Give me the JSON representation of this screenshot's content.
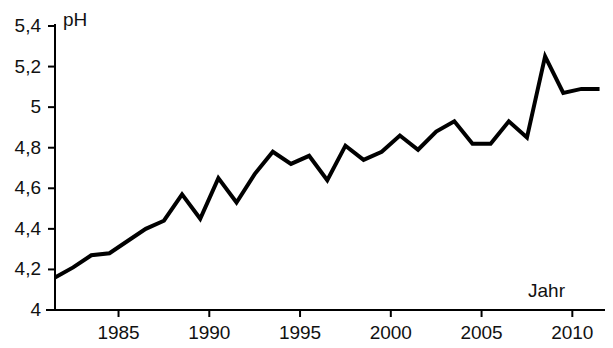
{
  "chart_data": {
    "type": "line",
    "title": "",
    "subtitle": "",
    "xlabel": "Jahr",
    "ylabel": "pH",
    "xlim": [
      1981.5,
      2011.8
    ],
    "ylim": [
      4,
      5.4
    ],
    "grid": false,
    "legend": null,
    "annotations": [],
    "y_ticks": [
      4,
      4.2,
      4.4,
      4.6,
      4.8,
      5,
      5.2,
      5.4
    ],
    "y_tick_labels": [
      "4",
      "4,2",
      "4,4",
      "4,6",
      "4,8",
      "5",
      "5,2",
      "5,4"
    ],
    "x_ticks": [
      1985,
      1990,
      1995,
      2000,
      2005,
      2010
    ],
    "x_tick_labels": [
      "1985",
      "1990",
      "1995",
      "2000",
      "2005",
      "2010"
    ],
    "series": [
      {
        "name": "pH",
        "color": "#000000",
        "x": [
          1981.5,
          1982.5,
          1983.5,
          1984.5,
          1985.5,
          1986.5,
          1987.5,
          1988.5,
          1989.5,
          1990.5,
          1991.5,
          1992.5,
          1993.5,
          1994.5,
          1995.5,
          1996.5,
          1997.5,
          1998.5,
          1999.5,
          2000.5,
          2001.5,
          2002.5,
          2003.5,
          2004.5,
          2005.5,
          2006.5,
          2007.5,
          2008.5,
          2009.5,
          2010.5,
          2011.5
        ],
        "values": [
          4.16,
          4.21,
          4.27,
          4.28,
          4.34,
          4.4,
          4.44,
          4.57,
          4.45,
          4.65,
          4.53,
          4.67,
          4.78,
          4.72,
          4.76,
          4.64,
          4.81,
          4.74,
          4.78,
          4.86,
          4.79,
          4.88,
          4.93,
          4.82,
          4.82,
          4.93,
          4.85,
          5.25,
          5.07,
          5.09,
          5.09
        ]
      }
    ]
  },
  "axes": {
    "y_axis_name": "pH",
    "x_axis_name": "Jahr"
  }
}
